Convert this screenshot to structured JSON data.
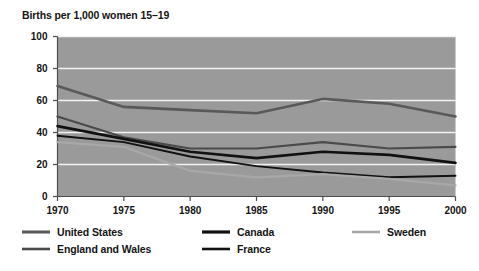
{
  "chart_data": {
    "type": "line",
    "title": "Births per 1,000 women 15–19",
    "xlabel": "",
    "ylabel": "",
    "x": [
      1970,
      1975,
      1980,
      1985,
      1990,
      1995,
      2000
    ],
    "xtick_labels": [
      "1970",
      "1975",
      "1980",
      "1985",
      "1990",
      "1995",
      "2000"
    ],
    "ytick_labels": [
      "0",
      "20",
      "40",
      "60",
      "80",
      "100"
    ],
    "yticks": [
      0,
      20,
      40,
      60,
      80,
      100
    ],
    "xlim": [
      1970,
      2000
    ],
    "ylim": [
      0,
      100
    ],
    "grid": "horizontal-white-gridlines",
    "legend_position": "below-axis",
    "plot_background": "#9a9a9a",
    "gridline_color": "#f2f2f2",
    "series": [
      {
        "name": "United States",
        "color": "#595959",
        "width": 2.6,
        "values": [
          69,
          56,
          54,
          52,
          61,
          58,
          50
        ]
      },
      {
        "name": "England and Wales",
        "color": "#4a4a4a",
        "width": 2.2,
        "values": [
          50,
          37,
          30,
          30,
          34,
          30,
          31
        ]
      },
      {
        "name": "Canada",
        "color": "#111111",
        "width": 2.6,
        "values": [
          44,
          36,
          28,
          24,
          28,
          26,
          21
        ]
      },
      {
        "name": "France",
        "color": "#111111",
        "width": 1.9,
        "values": [
          38,
          34,
          25,
          19,
          15,
          12,
          13
        ]
      },
      {
        "name": "Sweden",
        "color": "#a8a8a8",
        "width": 2.2,
        "values": [
          34,
          31,
          16,
          12,
          14,
          11,
          7
        ]
      }
    ]
  },
  "legend": {
    "items": [
      {
        "label": "United States",
        "color": "#595959",
        "width": 3.0
      },
      {
        "label": "Canada",
        "color": "#111111",
        "width": 3.2
      },
      {
        "label": "Sweden",
        "color": "#a8a8a8",
        "width": 2.6
      },
      {
        "label": "England and Wales",
        "color": "#4a4a4a",
        "width": 2.6
      },
      {
        "label": "France",
        "color": "#111111",
        "width": 2.6
      }
    ]
  }
}
